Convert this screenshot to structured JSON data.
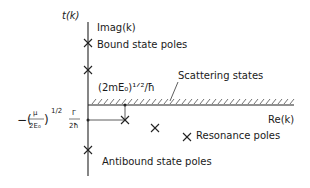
{
  "diagram": {
    "title_function": "t(k)",
    "axes": {
      "vertical_label": "Imag(k)",
      "horizontal_label": "Re(k)"
    },
    "labels": {
      "bound_state_poles": "Bound state poles",
      "scattering_states": "Scattering states",
      "threshold": "(2mE₀)¹ᐟ²/ħ",
      "resonance_poles": "Resonance poles",
      "antibound_state_poles": "Antibound state poles",
      "width_expression_prefix": "−(",
      "width_mu": "μ",
      "width_denominator": "2E₀",
      "width_close": ")",
      "width_exponent": "1/2",
      "width_gamma": "Γ",
      "width_gamma_denominator": "2ħ"
    },
    "poles": {
      "bound_count": 2,
      "antibound_count": 1,
      "resonance_count": 3
    }
  }
}
